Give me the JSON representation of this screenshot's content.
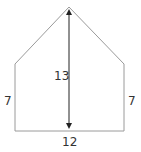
{
  "diagram": {
    "shape": "pentagon",
    "colors": {
      "edge": "#9a9a9a",
      "arrow": "#222222",
      "text": "#333333"
    },
    "labels": {
      "height": "13",
      "left_side": "7",
      "right_side": "7",
      "base": "12"
    }
  }
}
